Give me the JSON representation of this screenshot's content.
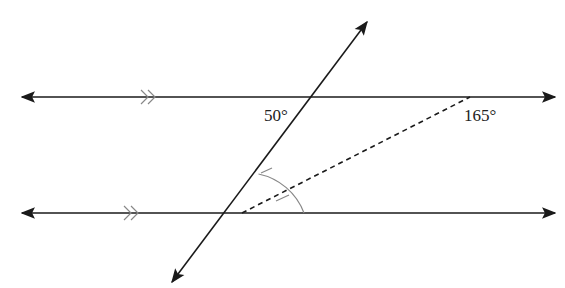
{
  "diagram": {
    "type": "geometry-parallel-lines-transversal",
    "labels": {
      "angle_top": "50°",
      "angle_right": "165°"
    },
    "elements": {
      "parallel_lines": 2,
      "transversal": 1,
      "dashed_bisector": 1,
      "parallel_marks": ">>"
    },
    "colors": {
      "line": "#1a1a1a",
      "mark": "#888888"
    }
  }
}
